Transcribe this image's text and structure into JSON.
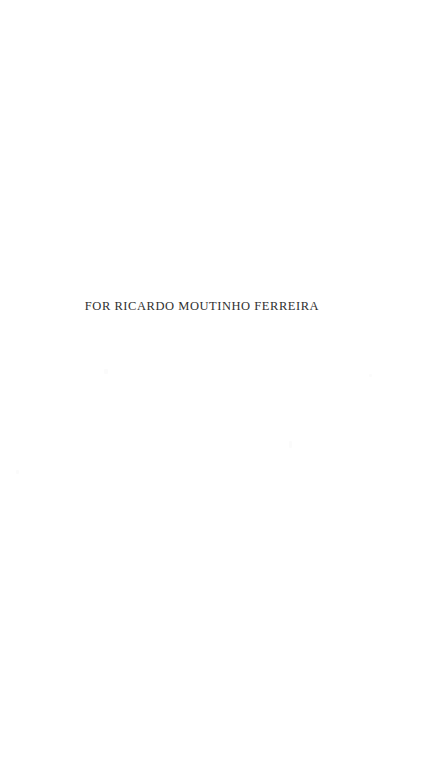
{
  "page": {
    "background_color": "#ffffff",
    "width": 432,
    "height": 768,
    "kind": "book-dedication-page"
  },
  "dedication": {
    "text": "FOR RICARDO MOUTINHO FERREIRA",
    "text_color": "#2f2f2f"
  }
}
